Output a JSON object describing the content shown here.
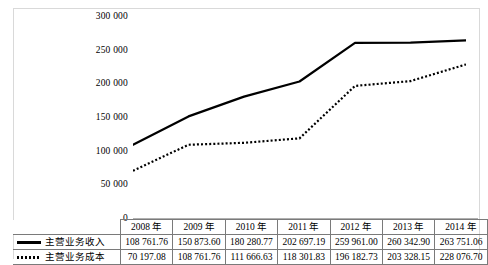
{
  "chart_data": {
    "type": "line",
    "title": "",
    "xlabel": "",
    "ylabel": "",
    "ylim": [
      0,
      300000
    ],
    "yticks": [
      "0",
      "50 000",
      "100 000",
      "150 000",
      "200 000",
      "250 000",
      "300 000"
    ],
    "grid": false,
    "legend_position": "table-row-labels",
    "categories": [
      "2008 年",
      "2009 年",
      "2010 年",
      "2011 年",
      "2012 年",
      "2013 年",
      "2014 年"
    ],
    "series": [
      {
        "name": "主营业务收入",
        "style": "solid",
        "color": "#000000",
        "values": [
          108761.76,
          150873.6,
          180280.77,
          202697.19,
          259961.0,
          260342.9,
          263751.06
        ],
        "labels": [
          "108 761.76",
          "150 873.60",
          "180 280.77",
          "202 697.19",
          "259 961.00",
          "260 342.90",
          "263 751.06"
        ]
      },
      {
        "name": "主营业务成本",
        "style": "dotted",
        "color": "#000000",
        "values": [
          70197.08,
          108761.76,
          111666.63,
          118301.83,
          196182.73,
          203328.15,
          228076.7
        ],
        "labels": [
          "70 197.08",
          "108 761.76",
          "111 666.63",
          "118 301.83",
          "196 182.73",
          "203 328.15",
          "228 076.70"
        ]
      }
    ]
  },
  "table": {
    "corner_label": "",
    "headers": [
      "2008 年",
      "2009 年",
      "2010 年",
      "2011 年",
      "2012 年",
      "2013 年",
      "2014 年"
    ],
    "rows": [
      {
        "label": "主营业务收入",
        "swatch": "solid-line-swatch",
        "cells": [
          "108 761.76",
          "150 873.60",
          "180 280.77",
          "202 697.19",
          "259 961.00",
          "260 342.90",
          "263 751.06"
        ]
      },
      {
        "label": "主营业务成本",
        "swatch": "dotted-line-swatch",
        "cells": [
          "70 197.08",
          "108 761.76",
          "111 666.63",
          "118 301.83",
          "196 182.73",
          "203 328.15",
          "228 076.70"
        ]
      }
    ]
  }
}
